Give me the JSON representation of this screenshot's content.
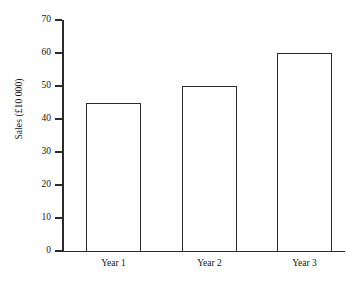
{
  "chart_data": {
    "type": "bar",
    "title": "",
    "subtitle": "",
    "xlabel": "",
    "ylabel": "Sales (£10 000)",
    "categories": [
      "Year 1",
      "Year 2",
      "Year 3"
    ],
    "values": [
      45,
      50,
      60
    ],
    "ylim": [
      0,
      70
    ],
    "y_ticks": [
      "0",
      "10",
      "20",
      "30",
      "40",
      "50",
      "60",
      "70"
    ],
    "y_tick_values": [
      0,
      10,
      20,
      30,
      40,
      50,
      60,
      70
    ],
    "y_tick_step": 10,
    "grid": false,
    "legend": false,
    "legend_position": "none",
    "bar_fill": "#ffffff",
    "bar_edge_color": "#2b2b2b",
    "axis_color": "#2b2b2b",
    "background": "#fefefe",
    "annotations": []
  },
  "axes": {
    "y_title": "Sales (£10 000)"
  }
}
